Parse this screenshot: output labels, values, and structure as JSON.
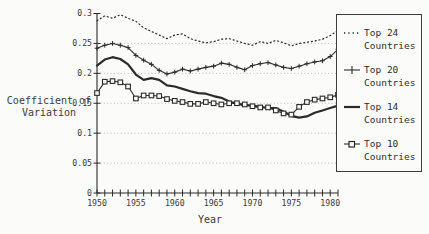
{
  "figure": {
    "y_axis_title": "Coefficient of Variation",
    "x_axis_title": "Year"
  },
  "chart_data": {
    "type": "line",
    "title": "",
    "xlabel": "Year",
    "ylabel": "Coefficient of Variation",
    "x_range": [
      1950,
      1981
    ],
    "ylim": [
      0,
      0.3
    ],
    "y_ticks": [
      0,
      0.05,
      0.1,
      0.15,
      0.2,
      0.25,
      0.3
    ],
    "y_tick_labels": [
      "0",
      "0.05",
      "0.1",
      "0.15",
      "0.2",
      "0.25",
      "0.3"
    ],
    "x_labeled_ticks": [
      1950,
      1955,
      1960,
      1965,
      1970,
      1975,
      1980
    ],
    "x_minor_tick_step": 1,
    "grid": "horizontal-dotted",
    "legend_position": "right-overlay",
    "x": [
      1950,
      1951,
      1952,
      1953,
      1954,
      1955,
      1956,
      1957,
      1958,
      1959,
      1960,
      1961,
      1962,
      1963,
      1964,
      1965,
      1966,
      1967,
      1968,
      1969,
      1970,
      1971,
      1972,
      1973,
      1974,
      1975,
      1976,
      1977,
      1978,
      1979,
      1980,
      1981
    ],
    "series": [
      {
        "name": "Top 24 Countries",
        "line": "dotted",
        "marker": "none",
        "values": [
          0.288,
          0.296,
          0.292,
          0.298,
          0.292,
          0.287,
          0.276,
          0.27,
          0.264,
          0.258,
          0.264,
          0.266,
          0.258,
          0.254,
          0.251,
          0.253,
          0.257,
          0.258,
          0.254,
          0.25,
          0.247,
          0.253,
          0.25,
          0.255,
          0.251,
          0.246,
          0.25,
          0.252,
          0.254,
          0.257,
          0.263,
          0.272
        ]
      },
      {
        "name": "Top 20 Countries",
        "line": "solid-thin",
        "marker": "plus",
        "values": [
          0.242,
          0.247,
          0.25,
          0.247,
          0.243,
          0.23,
          0.222,
          0.215,
          0.205,
          0.199,
          0.202,
          0.207,
          0.204,
          0.207,
          0.21,
          0.212,
          0.217,
          0.215,
          0.21,
          0.206,
          0.213,
          0.216,
          0.218,
          0.214,
          0.21,
          0.208,
          0.212,
          0.216,
          0.219,
          0.221,
          0.228,
          0.24
        ]
      },
      {
        "name": "Top 14 Countries",
        "line": "solid-thick",
        "marker": "none",
        "values": [
          0.213,
          0.223,
          0.227,
          0.224,
          0.215,
          0.198,
          0.189,
          0.192,
          0.189,
          0.18,
          0.178,
          0.174,
          0.17,
          0.167,
          0.166,
          0.162,
          0.159,
          0.153,
          0.149,
          0.147,
          0.146,
          0.144,
          0.142,
          0.142,
          0.136,
          0.129,
          0.126,
          0.128,
          0.134,
          0.138,
          0.142,
          0.146
        ]
      },
      {
        "name": "Top 10 Countries",
        "line": "solid-thin",
        "marker": "square",
        "values": [
          0.167,
          0.186,
          0.187,
          0.185,
          0.178,
          0.158,
          0.163,
          0.163,
          0.162,
          0.157,
          0.154,
          0.152,
          0.149,
          0.149,
          0.152,
          0.15,
          0.148,
          0.15,
          0.15,
          0.148,
          0.145,
          0.143,
          0.143,
          0.138,
          0.133,
          0.131,
          0.144,
          0.152,
          0.156,
          0.158,
          0.16,
          0.164
        ]
      }
    ],
    "colors": {
      "line": "#2b2b2b",
      "grid": "#a8a8a8",
      "background": "#fbfbf9"
    }
  }
}
